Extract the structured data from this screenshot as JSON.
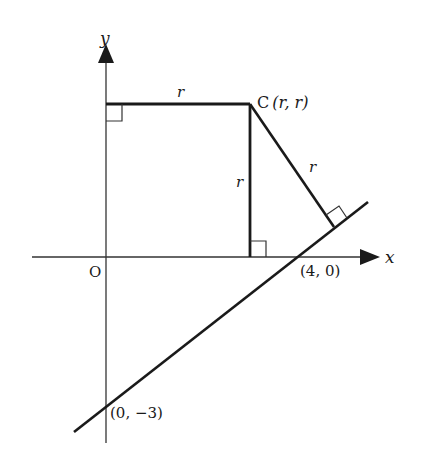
{
  "diagram": {
    "type": "coordinate-geometry",
    "colors": {
      "stroke": "#1a1a1a",
      "axis": "#333333",
      "background": "#ffffff"
    },
    "axes": {
      "x_label": "x",
      "y_label": "y",
      "origin_label": "O"
    },
    "points": {
      "centre_label": "C",
      "centre_coords": "(r, r)",
      "x_intercept": "(4, 0)",
      "y_intercept": "(0, −3)"
    },
    "segment_labels": {
      "to_y_axis": "r",
      "to_x_axis": "r",
      "to_tangent_line": "r"
    },
    "right_angle_markers": [
      "at y-axis",
      "at x-axis",
      "at tangent line"
    ]
  }
}
